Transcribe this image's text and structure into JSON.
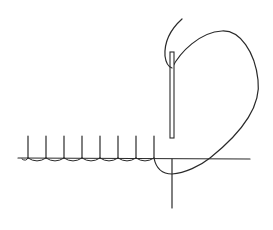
{
  "diagram": {
    "colors": {
      "background": "#ffffff",
      "ink": "#2a2a2a"
    },
    "fabric_edge": {
      "y": 158,
      "x_start": 18,
      "x_end": 250
    },
    "stitches": {
      "count": 8,
      "x_positions": [
        28,
        46,
        64,
        82,
        100,
        118,
        136,
        154
      ],
      "top_y": 136,
      "bottom_y": 158
    },
    "needle": {
      "x": 172,
      "top_y": 52,
      "bottom_y": 138,
      "width": 4
    },
    "vertical_thread": {
      "x": 172,
      "top_y": 159,
      "bottom_y": 208
    },
    "loop_path": "M 154 158 C 156 168, 162 174, 172 174 C 185 173, 200 166, 210 158 C 235 138, 262 110, 258 80 C 255 52, 240 30, 222 31 C 200 32, 180 52, 172 68",
    "tail_path": "M 182 19 C 172 28, 164 40, 165 56 C 166 64, 169 67, 172 68"
  }
}
